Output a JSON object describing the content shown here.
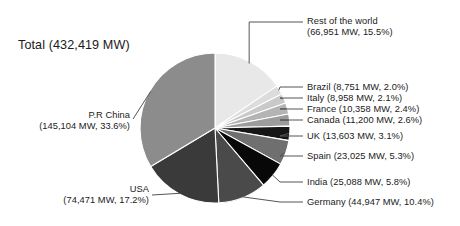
{
  "figure": {
    "total_label": "Total (432,419 MW)",
    "background": "#ffffff"
  },
  "chart_data": {
    "type": "pie",
    "title": "Total (432,419 MW)",
    "unit": "MW",
    "total_value": 432419,
    "total_text": "432,419 MW",
    "start_angle_deg": 0,
    "direction": "clockwise",
    "legend": "callout-labels",
    "grid": false,
    "labels": [
      "Rest of the world",
      "Brazil",
      "Italy",
      "France",
      "Canada",
      "UK",
      "Spain",
      "India",
      "Germany",
      "USA",
      "P.R China"
    ],
    "values": [
      66951,
      8751,
      8958,
      10358,
      11200,
      13603,
      23025,
      25088,
      44947,
      74471,
      145104
    ],
    "percents": [
      15.5,
      2.0,
      2.1,
      2.4,
      2.6,
      3.1,
      5.3,
      5.8,
      10.4,
      17.2,
      33.6
    ],
    "colors": [
      "#e8e8e8",
      "#dcdcdc",
      "#c9c9c9",
      "#b4b4b4",
      "#9c9c9c",
      "#161616",
      "#6f6f6f",
      "#080808",
      "#4a4a4a",
      "#3a3a3a",
      "#8c8c8c"
    ],
    "slices": [
      {
        "name": "Rest of the world",
        "value": 66951,
        "value_text": "66,951 MW",
        "percent": 15.5,
        "percent_text": "15.5%",
        "color": "#e8e8e8",
        "label_line1": "Rest of the world",
        "label_line2": "(66,951 MW, 15.5%)",
        "side": "right"
      },
      {
        "name": "Brazil",
        "value": 8751,
        "value_text": "8,751 MW",
        "percent": 2.0,
        "percent_text": "2.0%",
        "color": "#dcdcdc",
        "label_line1": "Brazil (8,751 MW, 2.0%)",
        "label_line2": "",
        "side": "right"
      },
      {
        "name": "Italy",
        "value": 8958,
        "value_text": "8,958 MW",
        "percent": 2.1,
        "percent_text": "2.1%",
        "color": "#c9c9c9",
        "label_line1": "Italy (8,958 MW, 2.1%)",
        "label_line2": "",
        "side": "right"
      },
      {
        "name": "France",
        "value": 10358,
        "value_text": "10,358 MW",
        "percent": 2.4,
        "percent_text": "2.4%",
        "color": "#b4b4b4",
        "label_line1": "France (10,358 MW, 2.4%)",
        "label_line2": "",
        "side": "right"
      },
      {
        "name": "Canada",
        "value": 11200,
        "value_text": "11,200 MW",
        "percent": 2.6,
        "percent_text": "2.6%",
        "color": "#9c9c9c",
        "label_line1": "Canada (11,200 MW, 2.6%)",
        "label_line2": "",
        "side": "right"
      },
      {
        "name": "UK",
        "value": 13603,
        "value_text": "13,603 MW",
        "percent": 3.1,
        "percent_text": "3.1%",
        "color": "#161616",
        "label_line1": "UK (13,603 MW, 3.1%)",
        "label_line2": "",
        "side": "right"
      },
      {
        "name": "Spain",
        "value": 23025,
        "value_text": "23,025 MW",
        "percent": 5.3,
        "percent_text": "5.3%",
        "color": "#6f6f6f",
        "label_line1": "Spain (23,025 MW, 5.3%)",
        "label_line2": "",
        "side": "right"
      },
      {
        "name": "India",
        "value": 25088,
        "value_text": "25,088 MW",
        "percent": 5.8,
        "percent_text": "5.8%",
        "color": "#080808",
        "label_line1": "India (25,088 MW, 5.8%)",
        "label_line2": "",
        "side": "right"
      },
      {
        "name": "Germany",
        "value": 44947,
        "value_text": "44,947 MW",
        "percent": 10.4,
        "percent_text": "10.4%",
        "color": "#4a4a4a",
        "label_line1": "Germany (44,947 MW, 10.4%)",
        "label_line2": "",
        "side": "right"
      },
      {
        "name": "USA",
        "value": 74471,
        "value_text": "74,471 MW",
        "percent": 17.2,
        "percent_text": "17.2%",
        "color": "#3a3a3a",
        "label_line1": "USA",
        "label_line2": "(74,471 MW, 17.2%)",
        "side": "left"
      },
      {
        "name": "P.R China",
        "value": 145104,
        "value_text": "145,104 MW",
        "percent": 33.6,
        "percent_text": "33.6%",
        "color": "#8c8c8c",
        "label_line1": "P.R China",
        "label_line2": "(145,104 MW, 33.6%)",
        "side": "left"
      }
    ]
  }
}
